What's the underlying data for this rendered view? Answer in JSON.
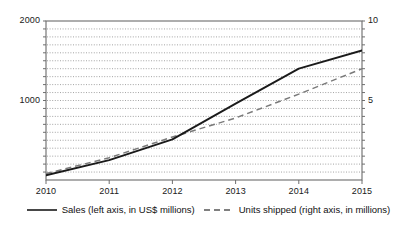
{
  "chart_data": {
    "type": "line",
    "title": "",
    "xlabel": "",
    "ylabel": "",
    "grid": true,
    "legend_position": "bottom",
    "x": [
      2010,
      2011,
      2012,
      2013,
      2014,
      2015
    ],
    "categories": [
      "2010",
      "2011",
      "2012",
      "2013",
      "2014",
      "2015"
    ],
    "xlim": [
      2010,
      2015
    ],
    "x_tick_labels": [
      "2010",
      "2011",
      "2012",
      "2013",
      "2014",
      "2015"
    ],
    "left_axis": {
      "label": "Sales (left axis, in US$ millions)",
      "ylim": [
        0,
        2000
      ],
      "tick_labels": [
        "1000",
        "2000"
      ],
      "ticks": [
        1000,
        2000
      ],
      "minor_gridline_step": 100
    },
    "right_axis": {
      "label": "Units shipped (right axis, in millions)",
      "ylim": [
        0,
        10
      ],
      "tick_labels": [
        "5",
        "10"
      ],
      "ticks": [
        5,
        10
      ],
      "minor_gridline_step": 0.5
    },
    "series": [
      {
        "name": "Sales (left axis, in US$ millions)",
        "axis": "left",
        "style": "solid",
        "color": "#1a1a1a",
        "values": [
          60,
          250,
          510,
          960,
          1400,
          1630
        ]
      },
      {
        "name": "Units shipped (right axis, in millions)",
        "axis": "right",
        "style": "dashed",
        "color": "#7a7a7a",
        "values": [
          0.4,
          1.4,
          2.7,
          3.9,
          5.4,
          7.0
        ]
      }
    ]
  },
  "legend": {
    "entries": [
      {
        "label": "Sales (left axis, in US$ millions)",
        "style": "solid",
        "color": "#1a1a1a"
      },
      {
        "label": "Units shipped (right axis, in millions)",
        "style": "dashed",
        "color": "#555555"
      }
    ]
  },
  "axis_labels": {
    "left": [
      "2000",
      "1000"
    ],
    "right": [
      "10",
      "5"
    ],
    "x": [
      "2010",
      "2011",
      "2012",
      "2013",
      "2014",
      "2015"
    ]
  },
  "colors": {
    "background": "#ffffff",
    "frame": "#6b6b6b",
    "gridline": "#8d8d8d",
    "series_sales": "#1a1a1a",
    "series_units": "#7a7a7a",
    "text": "#202020"
  }
}
